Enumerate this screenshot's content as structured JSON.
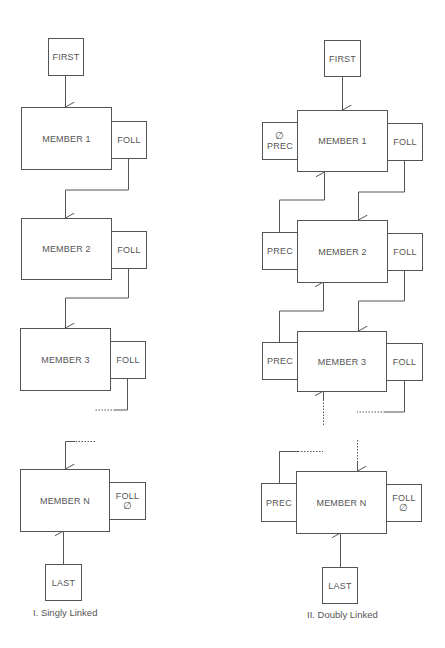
{
  "singly": {
    "caption": "I. Singly Linked",
    "first": "FIRST",
    "last": "LAST",
    "members": [
      {
        "label": "MEMBER 1",
        "foll": "FOLL"
      },
      {
        "label": "MEMBER 2",
        "foll": "FOLL"
      },
      {
        "label": "MEMBER 3",
        "foll": "FOLL"
      },
      {
        "label": "MEMBER N",
        "foll": "FOLL",
        "foll_null": "∅"
      }
    ]
  },
  "doubly": {
    "caption": "II. Doubly Linked",
    "first": "FIRST",
    "last": "LAST",
    "members": [
      {
        "label": "MEMBER 1",
        "prec": "PREC",
        "prec_null": "∅",
        "foll": "FOLL"
      },
      {
        "label": "MEMBER 2",
        "prec": "PREC",
        "foll": "FOLL"
      },
      {
        "label": "MEMBER 3",
        "prec": "PREC",
        "foll": "FOLL"
      },
      {
        "label": "MEMBER N",
        "prec": "PREC",
        "foll": "FOLL",
        "foll_null": "∅"
      }
    ]
  },
  "colors": {
    "line": "#555555",
    "background": "#ffffff"
  }
}
